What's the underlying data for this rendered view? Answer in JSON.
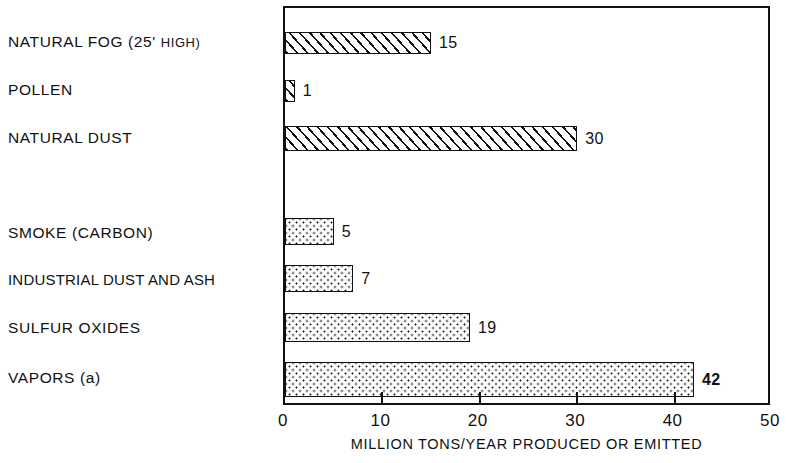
{
  "chart_data": {
    "type": "bar",
    "orientation": "horizontal",
    "title": "",
    "xlabel": "MILLION TONS/YEAR PRODUCED OR EMITTED",
    "ylabel": "",
    "xlim": [
      0,
      50
    ],
    "xticks": [
      0,
      10,
      20,
      30,
      40,
      50
    ],
    "xtick_labels": [
      "0",
      "10",
      "20",
      "30",
      "40",
      "50"
    ],
    "grid": false,
    "legend": "none",
    "categories": [
      "NATURAL FOG (25' HIGH)",
      "POLLEN",
      "NATURAL DUST",
      "SMOKE (CARBON)",
      "INDUSTRIAL DUST AND ASH",
      "SULFUR OXIDES",
      "VAPORS (a)"
    ],
    "values": [
      15,
      1,
      30,
      5,
      7,
      19,
      42
    ],
    "value_labels": [
      "15",
      "1",
      "30",
      "5",
      "7",
      "19",
      "42"
    ],
    "fills": [
      "hatch",
      "hatch",
      "hatch",
      "dots",
      "dots",
      "dots",
      "dots"
    ],
    "groups": [
      {
        "name": "natural sources",
        "fill": "diagonal-hatch",
        "members": [
          0,
          1,
          2
        ]
      },
      {
        "name": "man-made sources",
        "fill": "stipple-dots",
        "members": [
          3,
          4,
          5,
          6
        ]
      }
    ]
  },
  "bars": [
    {
      "label": "NATURAL FOG (25' HIGH)",
      "label_main": "NATURAL FOG (25'",
      "label_small": "HIGH)",
      "value": 15,
      "value_text": "15",
      "fill": "hatch",
      "top": 30,
      "height": 22
    },
    {
      "label": "POLLEN",
      "value": 1,
      "value_text": "1",
      "fill": "hatch",
      "top": 78,
      "height": 22
    },
    {
      "label": "NATURAL DUST",
      "value": 30,
      "value_text": "30",
      "fill": "hatch",
      "top": 124,
      "height": 25
    },
    {
      "label": "SMOKE (CARBON)",
      "value": 5,
      "value_text": "5",
      "fill": "dots",
      "top": 216,
      "height": 27
    },
    {
      "label": "INDUSTRIAL DUST AND ASH",
      "value": 7,
      "value_text": "7",
      "fill": "dots",
      "top": 263,
      "height": 27
    },
    {
      "label": "SULFUR OXIDES",
      "value": 19,
      "value_text": "19",
      "fill": "dots",
      "top": 311,
      "height": 29
    },
    {
      "label": "VAPORS (a)",
      "label_main": "VAPORS (",
      "label_lower": "a",
      "label_tail": ")",
      "value": 42,
      "value_text": "42",
      "fill": "dots",
      "top": 360,
      "height": 35
    }
  ],
  "axis": {
    "caption": "MILLION TONS/YEAR PRODUCED OR EMITTED",
    "ticks": [
      {
        "value": 0,
        "label": "0"
      },
      {
        "value": 10,
        "label": "10"
      },
      {
        "value": 20,
        "label": "20"
      },
      {
        "value": 30,
        "label": "30"
      },
      {
        "value": 40,
        "label": "40"
      },
      {
        "value": 50,
        "label": "50"
      }
    ]
  },
  "colors": {
    "ink": "#111111",
    "paper": "#ffffff"
  }
}
